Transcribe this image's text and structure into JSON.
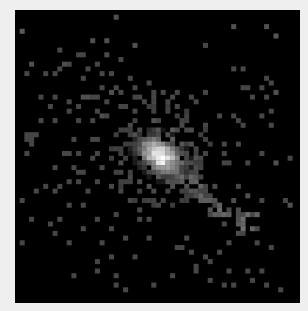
{
  "image": {
    "description": "Pixelated grayscale counts image of a bright diffuse source with an elongated tail toward lower-right on a black background",
    "frame": {
      "left": 15,
      "top": 10,
      "width": 285,
      "height": 293
    },
    "grid": {
      "cols": 61,
      "rows": 62,
      "cell": 4.7
    },
    "colors": {
      "background": "#efefef",
      "frame": "#000000"
    },
    "core": {
      "col": 30.5,
      "row": 30.5,
      "peak": 255,
      "sigma_major": 3.6,
      "sigma_minor": 2.4,
      "angle_deg": 35
    },
    "tail": {
      "from": [
        33,
        34
      ],
      "to": [
        50,
        46
      ],
      "level": 95
    },
    "pixels": [
      [
        1,
        4,
        90
      ],
      [
        21,
        1,
        80
      ],
      [
        46,
        3,
        80
      ],
      [
        53,
        3,
        80
      ],
      [
        55,
        5,
        85
      ],
      [
        16,
        6,
        80
      ],
      [
        19,
        6,
        80
      ],
      [
        9,
        8,
        70
      ],
      [
        25,
        7,
        80
      ],
      [
        40,
        7,
        70
      ],
      [
        13,
        9,
        70
      ],
      [
        14,
        9,
        70
      ],
      [
        19,
        9,
        75
      ],
      [
        22,
        10,
        70
      ],
      [
        3,
        11,
        80
      ],
      [
        10,
        11,
        80
      ],
      [
        11,
        11,
        70
      ],
      [
        9,
        12,
        70
      ],
      [
        15,
        12,
        70
      ],
      [
        8,
        13,
        70
      ],
      [
        18,
        13,
        70
      ],
      [
        2,
        13,
        70
      ],
      [
        6,
        13,
        70
      ],
      [
        20,
        13,
        70
      ],
      [
        46,
        12,
        70
      ],
      [
        48,
        12,
        70
      ],
      [
        14,
        14,
        70
      ],
      [
        17,
        11,
        70
      ],
      [
        24,
        14,
        70
      ],
      [
        28,
        15,
        70
      ],
      [
        53,
        14,
        70
      ],
      [
        54,
        15,
        70
      ],
      [
        18,
        16,
        70
      ],
      [
        20,
        17,
        80
      ],
      [
        21,
        16,
        70
      ],
      [
        22,
        17,
        70
      ],
      [
        25,
        16,
        70
      ],
      [
        29,
        17,
        70
      ],
      [
        31,
        17,
        70
      ],
      [
        34,
        17,
        70
      ],
      [
        40,
        17,
        70
      ],
      [
        49,
        16,
        70
      ],
      [
        48,
        16,
        70
      ],
      [
        52,
        16,
        70
      ],
      [
        55,
        17,
        80
      ],
      [
        5,
        18,
        70
      ],
      [
        8,
        18,
        70
      ],
      [
        14,
        18,
        80
      ],
      [
        15,
        18,
        80
      ],
      [
        16,
        18,
        70
      ],
      [
        17,
        18,
        70
      ],
      [
        25,
        18,
        70
      ],
      [
        26,
        18,
        70
      ],
      [
        29,
        18,
        70
      ],
      [
        33,
        18,
        70
      ],
      [
        37,
        18,
        70
      ],
      [
        38,
        19,
        70
      ],
      [
        50,
        18,
        70
      ],
      [
        53,
        18,
        70
      ],
      [
        19,
        19,
        70
      ],
      [
        7,
        20,
        70
      ],
      [
        11,
        19,
        70
      ],
      [
        13,
        20,
        70
      ],
      [
        27,
        19,
        70
      ],
      [
        29,
        19,
        70
      ],
      [
        32,
        19,
        70
      ],
      [
        22,
        20,
        70
      ],
      [
        23,
        20,
        70
      ],
      [
        25,
        21,
        70
      ],
      [
        34,
        20,
        70
      ],
      [
        11,
        21,
        70
      ],
      [
        17,
        21,
        70
      ],
      [
        18,
        22,
        80
      ],
      [
        19,
        22,
        70
      ],
      [
        43,
        22,
        70
      ],
      [
        46,
        22,
        70
      ],
      [
        47,
        23,
        70
      ],
      [
        52,
        22,
        70
      ],
      [
        54,
        21,
        70
      ],
      [
        5,
        23,
        70
      ],
      [
        8,
        23,
        70
      ],
      [
        13,
        23,
        70
      ],
      [
        16,
        23,
        70
      ],
      [
        40,
        24,
        70
      ],
      [
        48,
        24,
        70
      ],
      [
        54,
        24,
        70
      ],
      [
        2,
        26,
        70
      ],
      [
        3,
        26,
        70
      ],
      [
        4,
        26,
        70
      ],
      [
        2,
        27,
        70
      ],
      [
        3,
        27,
        70
      ],
      [
        3,
        28,
        70
      ],
      [
        12,
        27,
        70
      ],
      [
        16,
        27,
        70
      ],
      [
        17,
        27,
        70
      ],
      [
        44,
        28,
        70
      ],
      [
        47,
        28,
        70
      ],
      [
        44,
        30,
        70
      ],
      [
        52,
        30,
        70
      ],
      [
        2,
        30,
        70
      ],
      [
        10,
        30,
        70
      ],
      [
        11,
        30,
        70
      ],
      [
        13,
        30,
        70
      ],
      [
        16,
        31,
        70
      ],
      [
        17,
        30,
        70
      ],
      [
        8,
        33,
        70
      ],
      [
        12,
        33,
        70
      ],
      [
        13,
        34,
        70
      ],
      [
        14,
        34,
        70
      ],
      [
        18,
        33,
        70
      ],
      [
        44,
        32,
        70
      ],
      [
        45,
        32,
        70
      ],
      [
        49,
        32,
        70
      ],
      [
        55,
        32,
        80
      ],
      [
        58,
        31,
        70
      ],
      [
        6,
        37,
        70
      ],
      [
        9,
        37,
        70
      ],
      [
        11,
        36,
        70
      ],
      [
        13,
        36,
        70
      ],
      [
        17,
        36,
        70
      ],
      [
        20,
        37,
        70
      ],
      [
        40,
        37,
        70
      ],
      [
        47,
        37,
        70
      ],
      [
        40,
        38,
        70
      ],
      [
        41,
        39,
        70
      ],
      [
        1,
        40,
        70
      ],
      [
        4,
        38,
        70
      ],
      [
        8,
        38,
        70
      ],
      [
        15,
        38,
        70
      ],
      [
        22,
        38,
        70
      ],
      [
        11,
        41,
        70
      ],
      [
        14,
        41,
        70
      ],
      [
        24,
        40,
        70
      ],
      [
        26,
        42,
        70
      ],
      [
        30,
        41,
        70
      ],
      [
        49,
        39,
        80
      ],
      [
        57,
        40,
        70
      ],
      [
        58,
        41,
        80
      ],
      [
        52,
        40,
        70
      ],
      [
        3,
        44,
        70
      ],
      [
        9,
        44,
        70
      ],
      [
        17,
        44,
        70
      ],
      [
        21,
        43,
        70
      ],
      [
        26,
        44,
        70
      ],
      [
        28,
        44,
        70
      ],
      [
        41,
        43,
        70
      ],
      [
        42,
        43,
        70
      ],
      [
        45,
        42,
        70
      ],
      [
        49,
        43,
        70
      ],
      [
        50,
        43,
        70
      ],
      [
        44,
        45,
        70
      ],
      [
        48,
        45,
        70
      ],
      [
        51,
        46,
        70
      ],
      [
        20,
        46,
        70
      ],
      [
        14,
        46,
        70
      ],
      [
        23,
        48,
        70
      ],
      [
        28,
        48,
        70
      ],
      [
        36,
        48,
        70
      ],
      [
        48,
        47,
        70
      ],
      [
        51,
        49,
        70
      ],
      [
        1,
        49,
        70
      ],
      [
        7,
        45,
        70
      ],
      [
        8,
        47,
        70
      ],
      [
        11,
        49,
        70
      ],
      [
        18,
        49,
        70
      ],
      [
        34,
        50,
        70
      ],
      [
        35,
        50,
        70
      ],
      [
        37,
        51,
        70
      ],
      [
        43,
        51,
        70
      ],
      [
        54,
        50,
        70
      ],
      [
        45,
        49,
        70
      ],
      [
        17,
        53,
        70
      ],
      [
        20,
        52,
        70
      ],
      [
        25,
        52,
        70
      ],
      [
        40,
        52,
        70
      ],
      [
        41,
        53,
        70
      ],
      [
        38,
        55,
        70
      ],
      [
        45,
        55,
        70
      ],
      [
        49,
        55,
        70
      ],
      [
        52,
        55,
        70
      ],
      [
        12,
        56,
        70
      ],
      [
        17,
        55,
        70
      ],
      [
        21,
        56,
        70
      ],
      [
        33,
        56,
        70
      ],
      [
        38,
        54,
        70
      ],
      [
        21,
        58,
        70
      ],
      [
        29,
        58,
        70
      ],
      [
        41,
        57,
        70
      ],
      [
        44,
        58,
        70
      ],
      [
        46,
        58,
        70
      ],
      [
        50,
        57,
        70
      ],
      [
        53,
        58,
        70
      ],
      [
        23,
        59,
        70
      ],
      [
        56,
        59,
        70
      ]
    ]
  }
}
